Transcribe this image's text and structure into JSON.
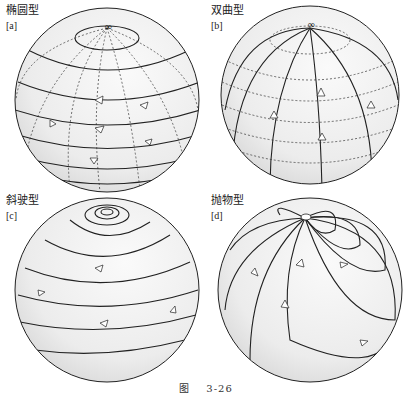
{
  "panels": [
    {
      "id": "a",
      "title": "椭圆型",
      "tag": "[a]"
    },
    {
      "id": "b",
      "title": "双曲型",
      "tag": "[b]"
    },
    {
      "id": "c",
      "title": "斜驶型",
      "tag": "[c]"
    },
    {
      "id": "d",
      "title": "抛物型",
      "tag": "[d]"
    }
  ],
  "caption": {
    "prefix": "图",
    "number": "3-26"
  },
  "colors": {
    "line": "#222222",
    "sphere_fill": "#eeeeee",
    "background": "#ffffff"
  }
}
